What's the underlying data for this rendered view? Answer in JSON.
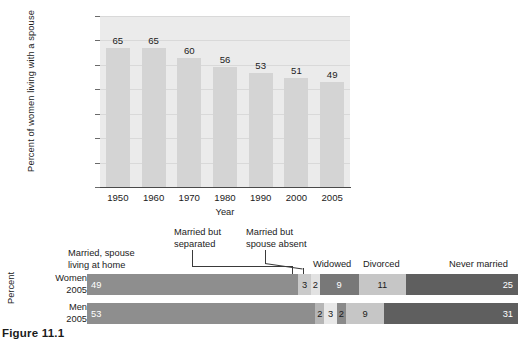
{
  "chart_data": [
    {
      "type": "bar",
      "title": "",
      "xlabel": "Year",
      "ylabel": "Percent of women living with a spouse",
      "categories": [
        "1950",
        "1960",
        "1970",
        "1980",
        "1990",
        "2000",
        "2005"
      ],
      "values": [
        65,
        65,
        60,
        56,
        53,
        51,
        49
      ],
      "ylim": [
        0,
        70
      ],
      "yticks": [
        "0",
        "10",
        "20",
        "30",
        "40",
        "50",
        "60",
        "70"
      ],
      "grid": true,
      "legend": "none",
      "bar_color": "#d4d4d4",
      "plot_background": "#ebebeb"
    },
    {
      "type": "bar",
      "subtype": "stacked-horizontal-100",
      "title": "",
      "xlabel": "",
      "ylabel": "Percent",
      "categories": [
        "Women\n2005",
        "Men\n2005"
      ],
      "segment_names": [
        "Married, spouse living at home",
        "Married but separated",
        "Married but spouse absent",
        "Widowed",
        "Divorced",
        "Never married"
      ],
      "segment_colors": [
        "#8e8e8e",
        "#cacaca",
        "#e2e2e2",
        "#787878",
        "#c6c6c6",
        "#5f5f5f"
      ],
      "series": [
        {
          "name": "Women 2005",
          "values": [
            49,
            3,
            2,
            9,
            11,
            25
          ]
        },
        {
          "name": "Men 2005",
          "values": [
            53,
            2,
            3,
            2,
            9,
            31
          ]
        }
      ],
      "xlim": [
        0,
        100
      ]
    }
  ],
  "top_chart": {
    "y_axis_title": "Percent of women living with a spouse",
    "x_axis_title": "Year",
    "y_ticks": [
      "70",
      "60",
      "50",
      "40",
      "30",
      "20",
      "10",
      "0"
    ],
    "bars": [
      {
        "year": "1950",
        "value": "65"
      },
      {
        "year": "1960",
        "value": "65"
      },
      {
        "year": "1970",
        "value": "60"
      },
      {
        "year": "1980",
        "value": "56"
      },
      {
        "year": "1990",
        "value": "53"
      },
      {
        "year": "2000",
        "value": "51"
      },
      {
        "year": "2005",
        "value": "49"
      }
    ]
  },
  "stacked_chart": {
    "axis_title": "Percent",
    "callouts": {
      "married_home": "Married, spouse\nliving at home",
      "married_home_line1": "Married, spouse",
      "married_home_line2": "living at home",
      "separated_line1": "Married but",
      "separated_line2": "separated",
      "absent_line1": "Married but",
      "absent_line2": "spouse absent",
      "widowed": "Widowed",
      "divorced": "Divorced",
      "never_married": "Never married"
    },
    "rows": [
      {
        "label_line1": "Women",
        "label_line2": "2005",
        "segments": [
          {
            "name": "married-spouse-home",
            "value": "49",
            "pct": 49,
            "color": "#8e8e8e",
            "text": "#ffffff",
            "align": "lead"
          },
          {
            "name": "married-separated",
            "value": "3",
            "pct": 3,
            "color": "#cacaca",
            "text": "#1b1b1b",
            "align": "center"
          },
          {
            "name": "married-spouse-absent",
            "value": "2",
            "pct": 2,
            "color": "#e2e2e2",
            "text": "#1b1b1b",
            "align": "center"
          },
          {
            "name": "widowed",
            "value": "9",
            "pct": 9,
            "color": "#787878",
            "text": "#ffffff",
            "align": "center"
          },
          {
            "name": "divorced",
            "value": "11",
            "pct": 11,
            "color": "#c6c6c6",
            "text": "#1b1b1b",
            "align": "center"
          },
          {
            "name": "never-married",
            "value": "25",
            "pct": 26,
            "color": "#5f5f5f",
            "text": "#ffffff",
            "align": "trail"
          }
        ]
      },
      {
        "label_line1": "Men",
        "label_line2": "2005",
        "segments": [
          {
            "name": "married-spouse-home",
            "value": "53",
            "pct": 53,
            "color": "#8e8e8e",
            "text": "#ffffff",
            "align": "lead"
          },
          {
            "name": "married-separated",
            "value": "2",
            "pct": 2,
            "color": "#b6b6b6",
            "text": "#1b1b1b",
            "align": "center"
          },
          {
            "name": "married-spouse-absent",
            "value": "3",
            "pct": 3,
            "color": "#e8e8e8",
            "text": "#1b1b1b",
            "align": "center"
          },
          {
            "name": "widowed",
            "value": "2",
            "pct": 2,
            "color": "#8a8a8a",
            "text": "#1b1b1b",
            "align": "center"
          },
          {
            "name": "divorced",
            "value": "9",
            "pct": 9,
            "color": "#c6c6c6",
            "text": "#1b1b1b",
            "align": "center"
          },
          {
            "name": "never-married",
            "value": "31",
            "pct": 31,
            "color": "#5f5f5f",
            "text": "#ffffff",
            "align": "trail"
          }
        ]
      }
    ]
  },
  "figure": {
    "caption": "Figure 11.1"
  }
}
